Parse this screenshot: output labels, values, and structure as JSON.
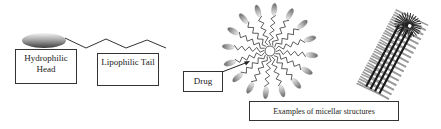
{
  "diagram": {
    "labels": {
      "head": "Hydrophilic Head",
      "tail": "Lipophilic Tail",
      "drug": "Drug",
      "examples": "Examples of micellar structures"
    },
    "elements": [
      {
        "id": "surfactant-head",
        "shape": "ellipse",
        "fill_gradient": [
          "#f2f2f2",
          "#9a9a9a",
          "#4a4a4a"
        ]
      },
      {
        "id": "surfactant-tail",
        "shape": "zigzag",
        "color": "#333333"
      },
      {
        "id": "spherical-micelle",
        "shape": "radial-surfactants",
        "count": 16
      },
      {
        "id": "cylindrical-micelle",
        "shape": "rod-micelle"
      }
    ],
    "arrows": [
      {
        "from": "drug",
        "to": "spherical-micelle-core"
      }
    ]
  }
}
